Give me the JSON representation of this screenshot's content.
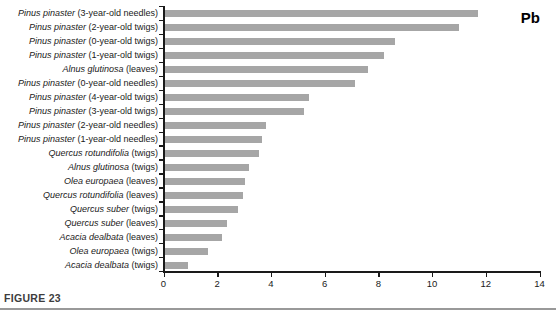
{
  "figure_caption": "FIGURE 23",
  "chart_data": {
    "type": "bar",
    "orientation": "horizontal",
    "title": "Pb",
    "xlabel": "",
    "ylabel": "",
    "xlim": [
      0,
      14
    ],
    "xticks": [
      0,
      2,
      4,
      6,
      8,
      10,
      12,
      14
    ],
    "grid": false,
    "legend": false,
    "bar_color": "#a6a6a6",
    "axis_color": "#1a1a1a",
    "categories": [
      "Pinus pinaster (3-year-old needles)",
      "Pinus pinaster (2-year-old twigs)",
      "Pinus pinaster (0-year-old twigs)",
      "Pinus pinaster (1-year-old twigs)",
      "Alnus glutinosa (leaves)",
      "Pinus pinaster (0-year-old needles)",
      "Pinus pinaster (4-year-old twigs)",
      "Pinus pinaster (3-year-old twigs)",
      "Pinus pinaster (2-year-old needles)",
      "Pinus pinaster (1-year-old needles)",
      "Quercus rotundifolia (twigs)",
      "Alnus glutinosa (twigs)",
      "Olea europaea (leaves)",
      "Quercus rotundifolia (leaves)",
      "Quercus suber (twigs)",
      "Quercus suber (leaves)",
      "Acacia dealbata (leaves)",
      "Olea europaea (twigs)",
      "Acacia dealbata (twigs)"
    ],
    "categories_rich": [
      {
        "species": "Pinus pinaster",
        "part": "(3-year-old needles)"
      },
      {
        "species": "Pinus pinaster",
        "part": "(2-year-old twigs)"
      },
      {
        "species": "Pinus pinaster",
        "part": "(0-year-old twigs)"
      },
      {
        "species": "Pinus pinaster",
        "part": "(1-year-old twigs)"
      },
      {
        "species": "Alnus glutinosa",
        "part": "(leaves)"
      },
      {
        "species": "Pinus pinaster",
        "part": "(0-year-old needles)"
      },
      {
        "species": "Pinus pinaster",
        "part": "(4-year-old twigs)"
      },
      {
        "species": "Pinus pinaster",
        "part": "(3-year-old twigs)"
      },
      {
        "species": "Pinus pinaster",
        "part": "(2-year-old needles)"
      },
      {
        "species": "Pinus pinaster",
        "part": "(1-year-old needles)"
      },
      {
        "species": "Quercus rotundifolia",
        "part": "(twigs)"
      },
      {
        "species": "Alnus glutinosa",
        "part": "(twigs)"
      },
      {
        "species": "Olea europaea",
        "part": "(leaves)"
      },
      {
        "species": "Quercus rotundifolia",
        "part": "(leaves)"
      },
      {
        "species": "Quercus suber",
        "part": "(twigs)"
      },
      {
        "species": "Quercus suber",
        "part": "(leaves)"
      },
      {
        "species": "Acacia dealbata",
        "part": "(leaves)"
      },
      {
        "species": "Olea europaea",
        "part": "(twigs)"
      },
      {
        "species": "Acacia dealbata",
        "part": "(twigs)"
      }
    ],
    "values": [
      11.7,
      11.0,
      8.6,
      8.2,
      7.6,
      7.1,
      5.4,
      5.2,
      3.8,
      3.65,
      3.55,
      3.15,
      3.0,
      2.95,
      2.75,
      2.35,
      2.15,
      1.65,
      0.9
    ]
  }
}
